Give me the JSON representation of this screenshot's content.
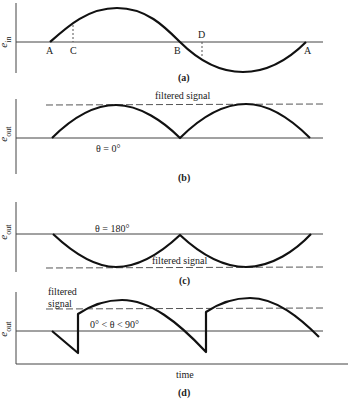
{
  "panels": [
    {
      "id": "a",
      "caption": "(a)",
      "ylabel_main": "e",
      "ylabel_sub": "in",
      "points": [
        "A",
        "C",
        "B",
        "D",
        "A"
      ],
      "description": "Input sine wave with marked points A, C, B, D, A"
    },
    {
      "id": "b",
      "caption": "(b)",
      "ylabel_main": "e",
      "ylabel_sub": "out",
      "annotation": "θ = 0°",
      "dashed_label": "filtered signal",
      "description": "Full-wave rectified positive output; filtered signal at peak level"
    },
    {
      "id": "c",
      "caption": "(c)",
      "ylabel_main": "e",
      "ylabel_sub": "out",
      "annotation": "θ = 180°",
      "dashed_label": "filtered signal",
      "description": "Full-wave rectified negative output; filtered signal at negative peak level"
    },
    {
      "id": "d",
      "caption": "(d)",
      "ylabel_main": "e",
      "ylabel_sub": "out",
      "annotation": "0° < θ < 90°",
      "dashed_label_line1": "filtered",
      "dashed_label_line2": "signal",
      "xlabel": "time",
      "description": "Phase-shifted demodulated output with discontinuities; positive average"
    }
  ],
  "colors": {
    "curve": "#111111",
    "axis": "#444444",
    "dashed": "#555555",
    "background": "#ffffff"
  }
}
